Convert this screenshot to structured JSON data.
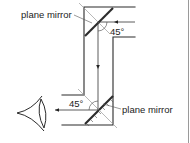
{
  "figure": {
    "type": "periscope",
    "labels": {
      "top_mirror": "plane mirror",
      "bottom_mirror": "plane mirror",
      "top_angle": "45°",
      "bottom_angle": "45°"
    },
    "colors": {
      "line": "#2b2b2b",
      "normal": "#9a9a9a",
      "background": "#ffffff"
    }
  }
}
